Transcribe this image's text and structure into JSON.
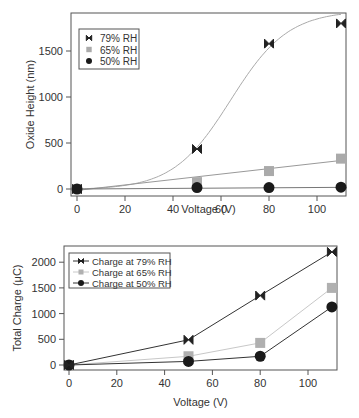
{
  "chart_data": [
    {
      "type": "scatter",
      "title": "",
      "xlabel": "Voltage (V)",
      "ylabel": "Oxide Height (nm)",
      "xlim": [
        -2,
        113
      ],
      "ylim": [
        -80,
        1920
      ],
      "xticks": [
        0,
        20,
        40,
        60,
        80,
        100
      ],
      "yticks": [
        0,
        500,
        1000,
        1500
      ],
      "grid": false,
      "legend_position": "upper left",
      "x": [
        0,
        50,
        80,
        110
      ],
      "series": [
        {
          "name": "79% RH",
          "marker": "bowtie",
          "color": "#222222",
          "values": [
            0,
            435,
            1580,
            1800
          ],
          "fit": "sigmoid"
        },
        {
          "name": "65% RH",
          "marker": "square",
          "color": "#aaaaaa",
          "values": [
            0,
            75,
            195,
            330
          ],
          "fit": "linear"
        },
        {
          "name": "50% RH",
          "marker": "circle",
          "color": "#1a1a1a",
          "values": [
            0,
            15,
            15,
            20
          ],
          "fit": "linear"
        }
      ]
    },
    {
      "type": "line",
      "title": "",
      "xlabel": "Voltage (V)",
      "ylabel": "Total Charge (μC)",
      "xlim": [
        -2,
        113
      ],
      "ylim": [
        -100,
        2320
      ],
      "xticks": [
        0,
        20,
        40,
        60,
        80,
        100
      ],
      "yticks": [
        0,
        500,
        1000,
        1500,
        2000
      ],
      "grid": false,
      "legend_position": "upper left",
      "x": [
        0,
        50,
        80,
        110
      ],
      "series": [
        {
          "name": "Charge at 79% RH",
          "marker": "bowtie",
          "color": "#222222",
          "values": [
            0,
            490,
            1350,
            2200
          ]
        },
        {
          "name": "Charge at 65% RH",
          "marker": "square",
          "color": "#b0b0b0",
          "values": [
            0,
            170,
            430,
            1500
          ]
        },
        {
          "name": "Charge at 50% RH",
          "marker": "circle",
          "color": "#1a1a1a",
          "values": [
            0,
            70,
            170,
            1130
          ]
        }
      ]
    }
  ]
}
